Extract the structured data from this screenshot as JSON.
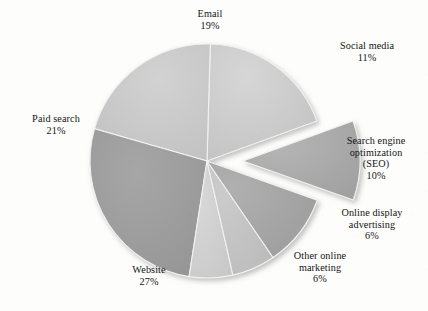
{
  "chart_data": {
    "type": "pie",
    "title": "",
    "subtitle": "",
    "xlabel": "",
    "ylabel": "",
    "legend_position": "labels-outside",
    "grid": false,
    "units": "percent",
    "start_angle_deg": -20,
    "direction": "clockwise",
    "categories": [
      "Email",
      "Social media",
      "Search engine optimization (SEO)",
      "Online display advertising",
      "Other online marketing",
      "Website",
      "Paid search"
    ],
    "values": [
      19,
      11,
      10,
      6,
      6,
      27,
      21
    ],
    "total": 100,
    "slices": [
      {
        "id": "email",
        "label": "Email",
        "value": 19,
        "value_text": "19%",
        "color": "#c9c9c9",
        "exploded": false,
        "label_lines": [
          "Email",
          "19%"
        ]
      },
      {
        "id": "social-media",
        "label": "Social media",
        "value": 11,
        "value_text": "11%",
        "color": "#a9a9a9",
        "exploded": true,
        "label_lines": [
          "Social media",
          "11%"
        ]
      },
      {
        "id": "seo",
        "label": "Search engine optimization (SEO)",
        "value": 10,
        "value_text": "10%",
        "color": "#a3a3a3",
        "exploded": false,
        "label_lines": [
          "Search engine",
          "optimization",
          "(SEO)",
          "10%"
        ]
      },
      {
        "id": "online-display-advertising",
        "label": "Online display advertising",
        "value": 6,
        "value_text": "6%",
        "color": "#c2c2c2",
        "exploded": false,
        "label_lines": [
          "Online display",
          "advertising",
          "6%"
        ]
      },
      {
        "id": "other-online-marketing",
        "label": "Other online marketing",
        "value": 6,
        "value_text": "6%",
        "color": "#cfcfcf",
        "exploded": false,
        "label_lines": [
          "Other online",
          "marketing",
          "6%"
        ]
      },
      {
        "id": "website",
        "label": "Website",
        "value": 27,
        "value_text": "27%",
        "color": "#9b9b9b",
        "exploded": false,
        "label_lines": [
          "Website",
          "27%"
        ]
      },
      {
        "id": "paid-search",
        "label": "Paid search",
        "value": 21,
        "value_text": "21%",
        "color": "#c6c6c6",
        "exploded": false,
        "label_lines": [
          "Paid search",
          "21%"
        ]
      }
    ]
  },
  "labels": {
    "email": {
      "name": "Email",
      "pct": "19%"
    },
    "social": {
      "name": "Social media",
      "pct": "11%"
    },
    "seo": {
      "line1": "Search engine",
      "line2": "optimization",
      "line3": "(SEO)",
      "pct": "10%"
    },
    "display": {
      "line1": "Online display",
      "line2": "advertising",
      "pct": "6%"
    },
    "otherol": {
      "line1": "Other online",
      "line2": "marketing",
      "pct": "6%"
    },
    "website": {
      "name": "Website",
      "pct": "27%"
    },
    "paid": {
      "name": "Paid search",
      "pct": "21%"
    }
  },
  "colors": {
    "background": "#fdfdfc",
    "text": "#141414",
    "slice_edge": "#f4f4f4",
    "shadow": "#b8b8b8"
  }
}
